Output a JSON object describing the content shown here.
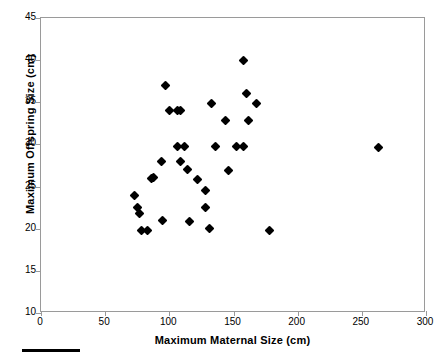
{
  "chart_data": {
    "type": "scatter",
    "title": "",
    "xlabel": "Maximum Maternal Size (cm)",
    "ylabel": "Maximum Offspring Size (cm)",
    "xlim": [
      0,
      300
    ],
    "ylim": [
      10,
      45
    ],
    "xticks": [
      0,
      50,
      100,
      150,
      200,
      250,
      300
    ],
    "yticks": [
      10,
      15,
      20,
      25,
      30,
      35,
      40,
      45
    ],
    "xtick_labels": [
      "0",
      "50",
      "100",
      "150",
      "200",
      "250",
      "300"
    ],
    "ytick_labels": [
      "10",
      "15",
      "20",
      "25",
      "30",
      "35",
      "40",
      "45"
    ],
    "grid": false,
    "legend": false,
    "marker": "diamond",
    "marker_color": "#000000",
    "frame_color": "#9a9a9a",
    "points": [
      {
        "x": 73,
        "y": 24.0
      },
      {
        "x": 75,
        "y": 22.5
      },
      {
        "x": 77,
        "y": 21.8
      },
      {
        "x": 78,
        "y": 19.8
      },
      {
        "x": 83,
        "y": 19.8
      },
      {
        "x": 86,
        "y": 26.0
      },
      {
        "x": 88,
        "y": 26.1
      },
      {
        "x": 94,
        "y": 28.0
      },
      {
        "x": 95,
        "y": 21.0
      },
      {
        "x": 97,
        "y": 37.0
      },
      {
        "x": 100,
        "y": 34.0
      },
      {
        "x": 106,
        "y": 34.0
      },
      {
        "x": 109,
        "y": 34.0
      },
      {
        "x": 106,
        "y": 29.8
      },
      {
        "x": 112,
        "y": 29.8
      },
      {
        "x": 109,
        "y": 28.0
      },
      {
        "x": 114,
        "y": 27.0
      },
      {
        "x": 116,
        "y": 20.8
      },
      {
        "x": 122,
        "y": 25.8
      },
      {
        "x": 128,
        "y": 24.5
      },
      {
        "x": 131,
        "y": 20.0
      },
      {
        "x": 128,
        "y": 22.5
      },
      {
        "x": 133,
        "y": 34.9
      },
      {
        "x": 136,
        "y": 29.8
      },
      {
        "x": 144,
        "y": 32.8
      },
      {
        "x": 146,
        "y": 26.9
      },
      {
        "x": 152,
        "y": 29.8
      },
      {
        "x": 158,
        "y": 40.0
      },
      {
        "x": 158,
        "y": 29.8
      },
      {
        "x": 160,
        "y": 36.0
      },
      {
        "x": 162,
        "y": 32.8
      },
      {
        "x": 168,
        "y": 34.8
      },
      {
        "x": 178,
        "y": 19.8
      },
      {
        "x": 263,
        "y": 29.6
      }
    ]
  },
  "figure": {
    "caption_rule": ""
  }
}
